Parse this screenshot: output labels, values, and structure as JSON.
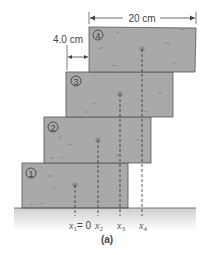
{
  "figure": {
    "caption": "(a)",
    "width_label": "20 cm",
    "offset_label": "4.0 cm",
    "colors": {
      "block_fill": "#a9a9a9",
      "block_stroke": "#555555",
      "ground": "#d8d8d8",
      "text": "#444444"
    },
    "blocks": [
      {
        "number": "1",
        "symbol": "①",
        "x_label_var": "x",
        "x_label_sub": "1",
        "x_label_value": "= 0"
      },
      {
        "number": "2",
        "symbol": "②",
        "x_label_var": "x",
        "x_label_sub": "2",
        "x_label_value": ""
      },
      {
        "number": "3",
        "symbol": "③",
        "x_label_var": "x",
        "x_label_sub": "3",
        "x_label_value": ""
      },
      {
        "number": "4",
        "symbol": "④",
        "x_label_var": "x",
        "x_label_sub": "4",
        "x_label_value": ""
      }
    ]
  }
}
